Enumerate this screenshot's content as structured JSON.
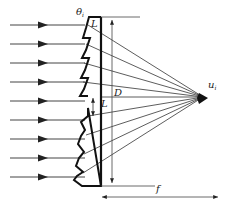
{
  "diagram": {
    "type": "fresnel-lens-ray-diagram",
    "incoming_ray_count": 9,
    "converging_ray_count": 9,
    "colors": {
      "line": "#222222",
      "background": "#ffffff"
    },
    "labels": {
      "theta": "θ",
      "theta_sub": "i",
      "L_top": "L",
      "L_mid": "L",
      "D": "D",
      "f": "f",
      "focal_point": "u",
      "focal_point_sub": "i"
    }
  }
}
